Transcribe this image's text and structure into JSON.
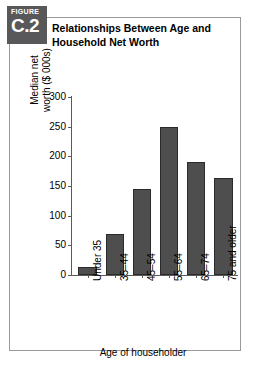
{
  "figure": {
    "badge_word": "FIGURE",
    "badge_number": "C.2",
    "title_line1": "Relationships Between Age and",
    "title_line2": "Household Net Worth"
  },
  "colors": {
    "bar_fill": "#4e4e4e",
    "bar_stroke": "#2b2b2b",
    "badge_bg": "#58585a",
    "frame": "#9a9a9a",
    "axis": "#5a5a5a"
  },
  "chart_data": {
    "type": "bar",
    "title": "Relationships Between Age and Household Net Worth",
    "categories": [
      "Under 35",
      "35–44",
      "45–54",
      "55–64",
      "65–74",
      "75 and older"
    ],
    "values": [
      14,
      69,
      145,
      249,
      190,
      164
    ],
    "xlabel": "Age of householder",
    "ylabel": "Median net worth ($ 000s)",
    "ylabel_line1": "Median net",
    "ylabel_line2": "worth ($ 000s)",
    "ylim": [
      0,
      300
    ],
    "yticks": [
      0,
      50,
      100,
      150,
      200,
      250,
      300
    ],
    "ytick_labels": [
      "0",
      "50",
      "100",
      "150",
      "200",
      "250",
      "300"
    ],
    "grid": false,
    "legend": false
  }
}
